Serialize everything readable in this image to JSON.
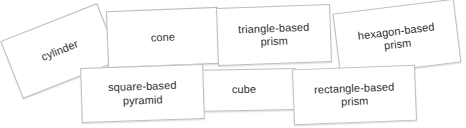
{
  "diagram": {
    "type": "card-sort",
    "background_color": "#ffffff",
    "card_fill_color": "#ffffff",
    "card_border_color": "#bdbdbd",
    "text_color": "#2e2e2e",
    "cards": [
      {
        "id": "cylinder",
        "label": "cylinder",
        "rotation_deg": -21.5,
        "row": "top"
      },
      {
        "id": "cone",
        "label": "cone",
        "rotation_deg": -2.2,
        "row": "top"
      },
      {
        "id": "triangle-based-prism",
        "label": "triangle-based\nprism",
        "rotation_deg": -2.0,
        "row": "top"
      },
      {
        "id": "hexagon-based-prism",
        "label": "hexagon-based\nprism",
        "rotation_deg": -7.0,
        "row": "top"
      },
      {
        "id": "square-based-pyramid",
        "label": "square-based\npyramid",
        "rotation_deg": -1.8,
        "row": "bottom"
      },
      {
        "id": "cube",
        "label": "cube",
        "rotation_deg": -1.2,
        "row": "bottom"
      },
      {
        "id": "rectangle-based-prism",
        "label": "rectangle-based\nprism",
        "rotation_deg": -2.2,
        "row": "bottom"
      }
    ]
  }
}
